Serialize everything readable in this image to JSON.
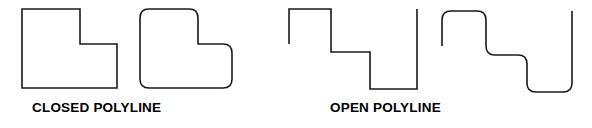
{
  "figure": {
    "width": 592,
    "height": 128,
    "background_color": "#ffffff",
    "stroke_color": "#1a1a1a",
    "stroke_width": 1.6,
    "groups": [
      {
        "caption": "CLOSED POLYLINE",
        "shapes": [
          {
            "name": "closed-polyline-sharp",
            "type": "closed",
            "corners": "sharp",
            "vertices": [
              [
                22,
                9
              ],
              [
                80,
                9
              ],
              [
                80,
                44
              ],
              [
                117,
                44
              ],
              [
                117,
                88
              ],
              [
                22,
                88
              ]
            ]
          },
          {
            "name": "closed-polyline-rounded",
            "type": "closed",
            "corners": "rounded",
            "radius": 9,
            "vertices": [
              [
                140,
                9
              ],
              [
                198,
                9
              ],
              [
                198,
                44
              ],
              [
                232,
                44
              ],
              [
                232,
                88
              ],
              [
                140,
                88
              ]
            ]
          }
        ]
      },
      {
        "caption": "OPEN POLYLINE",
        "shapes": [
          {
            "name": "open-polyline-sharp",
            "type": "open",
            "corners": "sharp",
            "vertices": [
              [
                289,
                44
              ],
              [
                289,
                9
              ],
              [
                331,
                9
              ],
              [
                331,
                52
              ],
              [
                370,
                52
              ],
              [
                370,
                89
              ],
              [
                417,
                89
              ],
              [
                417,
                9
              ]
            ]
          },
          {
            "name": "open-polyline-rounded",
            "type": "open",
            "corners": "rounded",
            "radius": 9,
            "vertices": [
              [
                442,
                46
              ],
              [
                442,
                11
              ],
              [
                486,
                11
              ],
              [
                486,
                55
              ],
              [
                527,
                55
              ],
              [
                527,
                92
              ],
              [
                572,
                92
              ],
              [
                572,
                11
              ]
            ]
          }
        ]
      }
    ]
  },
  "captions": {
    "closed": "CLOSED POLYLINE",
    "open": "OPEN POLYLINE"
  },
  "paths": {
    "closed_sharp": "M22,9 L80,9 L80,44 L117,44 L117,88 L22,88 Z",
    "closed_rounded": "M149,9 L189,9 Q198,9 198,18 L198,44 Q198,44 207,44 L223,44 Q232,44 232,53 L232,79 Q232,88 223,88 L149,88 Q140,88 140,79 L140,18 Q140,9 149,9 Z",
    "open_sharp": "M289,44 L289,9 L331,9 L331,52 L370,52 L370,89 L417,89 L417,9",
    "open_rounded": "M442,46 L442,20 Q442,11 451,11 L477,11 Q486,11 486,20 L486,46 Q486,55 495,55 L518,55 Q527,55 527,64 L527,83 Q527,92 536,92 L563,92 Q572,92 572,83 L572,11"
  }
}
